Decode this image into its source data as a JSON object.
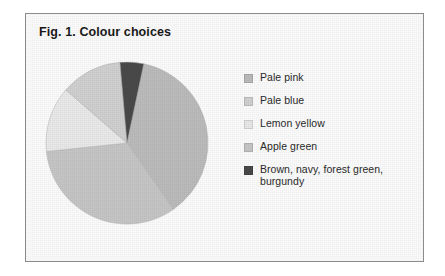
{
  "figure": {
    "title": "Fig. 1. Colour choices",
    "border_color": "#8c8c8c",
    "background": "#fdfdfd"
  },
  "chart_data": {
    "type": "pie",
    "title": "Fig. 1. Colour choices",
    "xlabel": "",
    "ylabel": "",
    "legend_position": "right",
    "grid": false,
    "start_angle_deg": 12,
    "direction": "clockwise",
    "categories": [
      "Pale pink",
      "Pale blue",
      "Lemon yellow",
      "Apple green",
      "Brown, navy, forest green, burgundy"
    ],
    "values": [
      37,
      12,
      13,
      33,
      5
    ],
    "units": "percent",
    "colors": [
      "#bdbdbd",
      "#d2d2d2",
      "#ebebeb",
      "#c7c7c7",
      "#4a4a4a"
    ],
    "slices": [
      {
        "label": "Pale pink",
        "value": 37,
        "color": "#bdbdbd",
        "start_deg": 12,
        "end_deg": 145
      },
      {
        "label": "Apple green",
        "value": 33,
        "color": "#c7c7c7",
        "start_deg": 145,
        "end_deg": 264
      },
      {
        "label": "Lemon yellow",
        "value": 13,
        "color": "#ebebeb",
        "start_deg": 264,
        "end_deg": 311
      },
      {
        "label": "Pale blue",
        "value": 12,
        "color": "#d2d2d2",
        "start_deg": 311,
        "end_deg": 355
      },
      {
        "label": "Brown, navy, forest green, burgundy",
        "value": 5,
        "color": "#4a4a4a",
        "start_deg": 355,
        "end_deg": 372
      }
    ]
  },
  "legend": {
    "items": [
      {
        "label": "Pale pink",
        "color": "#bdbdbd"
      },
      {
        "label": "Pale blue",
        "color": "#d2d2d2"
      },
      {
        "label": "Lemon yellow",
        "color": "#ebebeb"
      },
      {
        "label": "Apple green",
        "color": "#c7c7c7"
      },
      {
        "label": "Brown, navy, forest green, burgundy",
        "color": "#4a4a4a"
      }
    ]
  }
}
